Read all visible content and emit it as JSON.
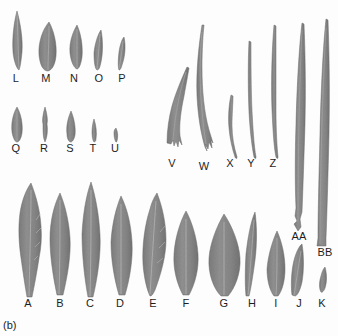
{
  "figure": {
    "panel_label": "(b)",
    "caption_visible": false,
    "background_color": "#fdfdfd",
    "leaf_fill_color": "#8b8b8b",
    "leaf_edge_color": "#6f6f6f",
    "midrib_color": "#a9a9a9",
    "label_color": "#1d1d1d",
    "image_type": "scanned-leaf-silhouette-plate"
  },
  "groups": [
    {
      "name": "row-1-top-left",
      "leaves": [
        {
          "label": "L",
          "label_x": 16,
          "label_y": 82,
          "shape": "narrow-lanceolate",
          "tip_x": 17,
          "tip_y": 12,
          "base_x": 18,
          "base_y": 70,
          "max_width": 11
        },
        {
          "label": "M",
          "label_x": 46,
          "label_y": 82,
          "shape": "ovate-lanceolate",
          "tip_x": 48,
          "tip_y": 22,
          "base_x": 47,
          "base_y": 71,
          "max_width": 17
        },
        {
          "label": "N",
          "label_x": 74,
          "label_y": 82,
          "shape": "lanceolate",
          "tip_x": 76,
          "tip_y": 26,
          "base_x": 76,
          "base_y": 69,
          "max_width": 13
        },
        {
          "label": "O",
          "label_x": 99,
          "label_y": 82,
          "shape": "narrow-lanceolate",
          "tip_x": 100,
          "tip_y": 30,
          "base_x": 97,
          "base_y": 70,
          "max_width": 9
        },
        {
          "label": "P",
          "label_x": 122,
          "label_y": 82,
          "shape": "very-narrow-falcate",
          "tip_x": 122,
          "tip_y": 38,
          "base_x": 119,
          "base_y": 70,
          "max_width": 7
        }
      ]
    },
    {
      "name": "row-2-middle-left",
      "leaves": [
        {
          "label": "Q",
          "label_x": 16,
          "label_y": 152,
          "shape": "elliptic-small",
          "tip_x": 17,
          "tip_y": 108,
          "base_x": 17,
          "base_y": 142,
          "max_width": 11
        },
        {
          "label": "R",
          "label_x": 44,
          "label_y": 152,
          "shape": "linear-narrow",
          "tip_x": 45,
          "tip_y": 108,
          "base_x": 45,
          "base_y": 142,
          "max_width": 6
        },
        {
          "label": "S",
          "label_x": 70,
          "label_y": 152,
          "shape": "narrow-elliptic",
          "tip_x": 71,
          "tip_y": 112,
          "base_x": 71,
          "base_y": 142,
          "max_width": 8
        },
        {
          "label": "T",
          "label_x": 93,
          "label_y": 152,
          "shape": "linear-tiny",
          "tip_x": 94,
          "tip_y": 120,
          "base_x": 94,
          "base_y": 142,
          "max_width": 5
        },
        {
          "label": "U",
          "label_x": 115,
          "label_y": 152,
          "shape": "linear-minute",
          "tip_x": 116,
          "tip_y": 128,
          "base_x": 116,
          "base_y": 141,
          "max_width": 4
        }
      ]
    },
    {
      "name": "row-3-tall-narrow-upper-right",
      "leaves": [
        {
          "label": "V",
          "label_x": 172,
          "label_y": 167,
          "shape": "long-falcate-forked-base",
          "tip_x": 186,
          "tip_y": 68,
          "base_x": 172,
          "base_y": 158,
          "max_width": 9
        },
        {
          "label": "W",
          "label_x": 204,
          "label_y": 170,
          "shape": "long-falcate-forked-base",
          "tip_x": 202,
          "tip_y": 26,
          "base_x": 205,
          "base_y": 160,
          "max_width": 9
        },
        {
          "label": "X",
          "label_x": 230,
          "label_y": 167,
          "shape": "linear-grass",
          "tip_x": 231,
          "tip_y": 96,
          "base_x": 235,
          "base_y": 158,
          "max_width": 6
        },
        {
          "label": "Y",
          "label_x": 251,
          "label_y": 167,
          "shape": "linear-grass",
          "tip_x": 249,
          "tip_y": 42,
          "base_x": 253,
          "base_y": 158,
          "max_width": 5
        },
        {
          "label": "Z",
          "label_x": 273,
          "label_y": 167,
          "shape": "linear-grass",
          "tip_x": 274,
          "tip_y": 26,
          "base_x": 275,
          "base_y": 158,
          "max_width": 5
        },
        {
          "label": "AA",
          "label_x": 299,
          "label_y": 240,
          "shape": "long-strap",
          "tip_x": 301,
          "tip_y": 24,
          "base_x": 297,
          "base_y": 230,
          "max_width": 9
        },
        {
          "label": "BB",
          "label_x": 325,
          "label_y": 256,
          "shape": "long-strap",
          "tip_x": 325,
          "tip_y": 20,
          "base_x": 321,
          "base_y": 246,
          "max_width": 10
        }
      ]
    },
    {
      "name": "row-4-bottom",
      "leaves": [
        {
          "label": "A",
          "label_x": 28,
          "label_y": 307,
          "shape": "broad-lanceolate-toothed",
          "tip_x": 30,
          "tip_y": 184,
          "base_x": 29,
          "base_y": 298,
          "max_width": 24
        },
        {
          "label": "B",
          "label_x": 60,
          "label_y": 307,
          "shape": "lanceolate",
          "tip_x": 60,
          "tip_y": 194,
          "base_x": 59,
          "base_y": 296,
          "max_width": 20
        },
        {
          "label": "C",
          "label_x": 90,
          "label_y": 307,
          "shape": "narrow-lanceolate",
          "tip_x": 91,
          "tip_y": 183,
          "base_x": 90,
          "base_y": 298,
          "max_width": 18
        },
        {
          "label": "D",
          "label_x": 120,
          "label_y": 307,
          "shape": "lanceolate",
          "tip_x": 120,
          "tip_y": 197,
          "base_x": 121,
          "base_y": 296,
          "max_width": 20
        },
        {
          "label": "E",
          "label_x": 153,
          "label_y": 307,
          "shape": "ovate-lanceolate-toothed",
          "tip_x": 156,
          "tip_y": 194,
          "base_x": 151,
          "base_y": 297,
          "max_width": 24
        },
        {
          "label": "F",
          "label_x": 186,
          "label_y": 307,
          "shape": "elliptic",
          "tip_x": 186,
          "tip_y": 212,
          "base_x": 185,
          "base_y": 296,
          "max_width": 24
        },
        {
          "label": "G",
          "label_x": 224,
          "label_y": 307,
          "shape": "broad-elliptic",
          "tip_x": 224,
          "tip_y": 215,
          "base_x": 224,
          "base_y": 296,
          "max_width": 30
        },
        {
          "label": "H",
          "label_x": 252,
          "label_y": 307,
          "shape": "narrow-falcate",
          "tip_x": 254,
          "tip_y": 213,
          "base_x": 250,
          "base_y": 296,
          "max_width": 12
        },
        {
          "label": "I",
          "label_x": 276,
          "label_y": 307,
          "shape": "elliptic",
          "tip_x": 277,
          "tip_y": 232,
          "base_x": 276,
          "base_y": 296,
          "max_width": 18
        },
        {
          "label": "J",
          "label_x": 299,
          "label_y": 307,
          "shape": "narrow-elliptic",
          "tip_x": 301,
          "tip_y": 245,
          "base_x": 296,
          "base_y": 296,
          "max_width": 13
        },
        {
          "label": "K",
          "label_x": 322,
          "label_y": 307,
          "shape": "small-falcate",
          "tip_x": 324,
          "tip_y": 268,
          "base_x": 320,
          "base_y": 292,
          "max_width": 8
        }
      ]
    }
  ],
  "label_sequence": [
    "L",
    "M",
    "N",
    "O",
    "P",
    "Q",
    "R",
    "S",
    "T",
    "U",
    "V",
    "W",
    "X",
    "Y",
    "Z",
    "AA",
    "BB",
    "A",
    "B",
    "C",
    "D",
    "E",
    "F",
    "G",
    "H",
    "I",
    "J",
    "K"
  ]
}
